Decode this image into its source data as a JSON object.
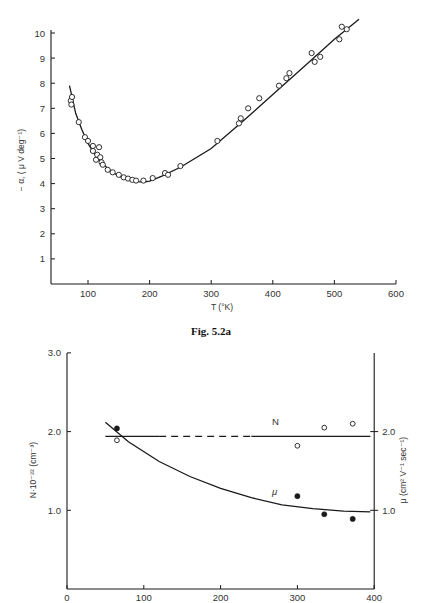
{
  "chart_data": [
    {
      "type": "scatter",
      "title": "",
      "caption": "Fig. 5.2a",
      "xlabel": "T (°K)",
      "ylabel": "− α, ( μ V deg⁻¹)",
      "xlim": [
        40,
        600
      ],
      "ylim": [
        0,
        10
      ],
      "xticks": [
        100,
        200,
        300,
        400,
        500,
        600
      ],
      "yticks": [
        1,
        2,
        3,
        4,
        5,
        6,
        7,
        8,
        9,
        10
      ],
      "grid": false,
      "series": [
        {
          "name": "measured",
          "marker": "open-circle",
          "points": [
            [
              72,
              7.3
            ],
            [
              73,
              7.15
            ],
            [
              74,
              7.45
            ],
            [
              85,
              6.45
            ],
            [
              95,
              5.85
            ],
            [
              100,
              5.7
            ],
            [
              108,
              5.5
            ],
            [
              108,
              5.3
            ],
            [
              113,
              4.95
            ],
            [
              115,
              5.15
            ],
            [
              118,
              5.45
            ],
            [
              120,
              5.05
            ],
            [
              122,
              4.85
            ],
            [
              124,
              4.75
            ],
            [
              132,
              4.55
            ],
            [
              140,
              4.45
            ],
            [
              150,
              4.35
            ],
            [
              158,
              4.25
            ],
            [
              165,
              4.2
            ],
            [
              172,
              4.15
            ],
            [
              178,
              4.12
            ],
            [
              190,
              4.12
            ],
            [
              205,
              4.22
            ],
            [
              225,
              4.42
            ],
            [
              230,
              4.35
            ],
            [
              250,
              4.7
            ],
            [
              310,
              5.7
            ],
            [
              345,
              6.4
            ],
            [
              348,
              6.6
            ],
            [
              360,
              7.0
            ],
            [
              378,
              7.4
            ],
            [
              410,
              7.9
            ],
            [
              422,
              8.2
            ],
            [
              427,
              8.4
            ],
            [
              463,
              9.2
            ],
            [
              468,
              8.85
            ],
            [
              477,
              9.05
            ],
            [
              508,
              9.75
            ],
            [
              512,
              10.25
            ],
            [
              520,
              10.15
            ]
          ]
        },
        {
          "name": "fit",
          "marker": "line",
          "points": [
            [
              70,
              7.9
            ],
            [
              80,
              6.8
            ],
            [
              90,
              6.15
            ],
            [
              100,
              5.6
            ],
            [
              110,
              5.2
            ],
            [
              120,
              4.9
            ],
            [
              130,
              4.65
            ],
            [
              140,
              4.45
            ],
            [
              150,
              4.3
            ],
            [
              160,
              4.2
            ],
            [
              170,
              4.12
            ],
            [
              180,
              4.08
            ],
            [
              190,
              4.06
            ],
            [
              200,
              4.1
            ],
            [
              220,
              4.3
            ],
            [
              250,
              4.65
            ],
            [
              300,
              5.4
            ],
            [
              350,
              6.45
            ],
            [
              400,
              7.55
            ],
            [
              450,
              8.65
            ],
            [
              500,
              9.75
            ],
            [
              540,
              10.55
            ]
          ]
        }
      ]
    },
    {
      "type": "scatter",
      "title": "",
      "xlabel": "",
      "ylabel_left": "N·10⁻²² (cm⁻³)",
      "ylabel_right": "μ (cm² V⁻¹ sec⁻¹)",
      "xlim": [
        0,
        400
      ],
      "ylim_left": [
        0,
        3.0
      ],
      "ylim_right": [
        0,
        3.0
      ],
      "xticks": [
        0,
        100,
        200,
        300,
        400
      ],
      "yticks_left": [
        "1.0",
        "2.0",
        "3.0"
      ],
      "yticks_right": [
        "1.0",
        "2.0"
      ],
      "grid": false,
      "series": [
        {
          "name": "N",
          "label": "N",
          "marker": "open-circle",
          "points": [
            [
              65,
              1.89
            ],
            [
              300,
              1.82
            ],
            [
              335,
              2.05
            ],
            [
              372,
              2.1
            ]
          ],
          "fit": {
            "value": 1.94,
            "x_start": 50,
            "x_end": 395,
            "dashed_from": 120,
            "dashed_to": 240
          }
        },
        {
          "name": "mu",
          "label": "μ",
          "marker": "filled-circle",
          "points": [
            [
              65,
              2.04
            ],
            [
              300,
              1.18
            ],
            [
              335,
              0.95
            ],
            [
              372,
              0.89
            ]
          ],
          "fit_points": [
            [
              50,
              2.12
            ],
            [
              80,
              1.87
            ],
            [
              120,
              1.62
            ],
            [
              160,
              1.43
            ],
            [
              200,
              1.28
            ],
            [
              240,
              1.16
            ],
            [
              280,
              1.07
            ],
            [
              320,
              1.02
            ],
            [
              360,
              0.99
            ],
            [
              395,
              0.98
            ]
          ]
        }
      ]
    }
  ]
}
